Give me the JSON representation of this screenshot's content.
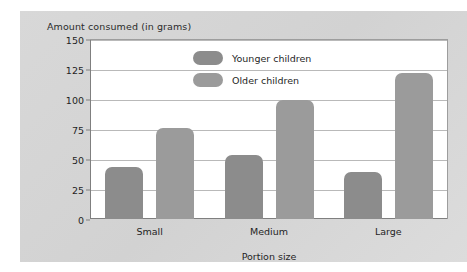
{
  "chart_data": {
    "type": "bar",
    "title": "Amount consumed (in grams)",
    "xlabel": "Portion size",
    "ylabel": "",
    "categories": [
      "Small",
      "Medium",
      "Large"
    ],
    "series": [
      {
        "name": "Younger children",
        "values": [
          43,
          53,
          39
        ],
        "color": "#8c8c8c"
      },
      {
        "name": "Older children",
        "values": [
          76,
          99,
          122
        ],
        "color": "#9b9b9b"
      }
    ],
    "ylim": [
      0,
      150
    ],
    "yticks": [
      0,
      25,
      50,
      75,
      100,
      125,
      150
    ],
    "ytick_labels": [
      "0",
      "25",
      "50",
      "75",
      "100",
      "125",
      "150"
    ],
    "grid": true,
    "legend_position": "upper-center-inside",
    "plot_background": "#ffffff",
    "panel_background": "#d6d6d6",
    "gridline_color": "#b9b9b9",
    "axis_color": "#7f7f7f",
    "text_color": "#1f1f1f"
  }
}
